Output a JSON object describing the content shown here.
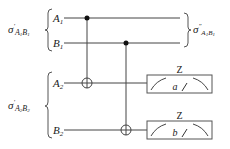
{
  "diagram": {
    "type": "quantum-circuit",
    "input_states": [
      {
        "symbol": "σ",
        "prime": "′",
        "subscript_1": "A",
        "sub_1": "1",
        "subscript_2": "B",
        "sub_2": "1"
      },
      {
        "symbol": "σ",
        "prime": "′",
        "subscript_1": "A",
        "sub_1": "2",
        "subscript_2": "B",
        "sub_2": "2"
      }
    ],
    "output_state": {
      "symbol": "σ",
      "prime": "″",
      "subscript_1": "A",
      "sub_1": "1",
      "subscript_2": "B",
      "sub_2": "1"
    },
    "wires": [
      {
        "name": "A",
        "index": "1"
      },
      {
        "name": "B",
        "index": "1"
      },
      {
        "name": "A",
        "index": "2"
      },
      {
        "name": "B",
        "index": "2"
      }
    ],
    "gates": [
      {
        "type": "CNOT",
        "control": "A1",
        "target": "A2"
      },
      {
        "type": "CNOT",
        "control": "B1",
        "target": "B2"
      }
    ],
    "measurements": [
      {
        "wire": "A2",
        "basis": "Z",
        "outcome": "a"
      },
      {
        "wire": "B2",
        "basis": "Z",
        "outcome": "b"
      }
    ],
    "colors": {
      "line": "#333333",
      "background": "#ffffff"
    }
  }
}
